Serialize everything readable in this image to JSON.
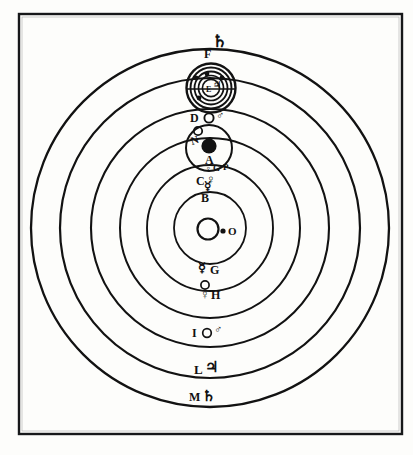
{
  "figure": {
    "caption": "",
    "frame_color": "#17181a",
    "ink_color": "#111111",
    "paper_color": "#fdfdfb",
    "corner_mark": ""
  },
  "center": {
    "body_name": "sun",
    "label": "O",
    "symbol": ""
  },
  "orbits": [
    {
      "key": "B",
      "label": "B",
      "symbol": "☿",
      "body": "mercury",
      "radius": 38,
      "label_angle": "bottom"
    },
    {
      "key": "C",
      "label": "C",
      "symbol": "♀",
      "body": "venus",
      "radius": 62,
      "label_angle": "top"
    },
    {
      "key": "A",
      "label": "A",
      "symbol": "",
      "body": "earth",
      "radius": 88,
      "label_angle": "top"
    },
    {
      "key": "D",
      "label": "D",
      "symbol": "♂",
      "body": "mars",
      "radius": 118,
      "label_angle": "top"
    },
    {
      "key": "F",
      "label": "F",
      "symbol": "♃",
      "body": "jupiter",
      "radius": 156,
      "label_angle": "top"
    },
    {
      "key": "M",
      "label": "M",
      "symbol": "♄",
      "body": "saturn",
      "radius": 190,
      "label_angle": "bottom"
    }
  ],
  "orbit_labels_lower": [
    {
      "key": "G",
      "label": "G",
      "symbol": "☿",
      "body": "mercury-lower"
    },
    {
      "key": "H",
      "label": "H",
      "symbol": "♀",
      "body": "venus-lower"
    },
    {
      "key": "I",
      "label": "I",
      "symbol": "♂",
      "body": "mars-lower"
    },
    {
      "key": "L",
      "label": "L",
      "symbol": "♃",
      "body": "jupiter-lower"
    },
    {
      "key": "M",
      "label": "M",
      "symbol": "♄",
      "body": "saturn-lower"
    }
  ],
  "jupiter_system": {
    "name": "jupiter-with-medicean-moons",
    "planet_label": "F",
    "planet_symbol": "♃",
    "top_symbol": "♄",
    "inner_label": "E",
    "moon_count": 4,
    "moon_names": [
      "io",
      "europa",
      "ganymede",
      "callisto"
    ]
  },
  "earth_system": {
    "name": "earth-with-moon",
    "planet_label": "A",
    "moon_orbit_label": "N",
    "moon_label": "N"
  },
  "mars_marker": {
    "label": "D",
    "symbol": "♂"
  },
  "inner_cluster": {
    "venus_label": "C",
    "venus_symbol": "♀",
    "mercury_label": "B",
    "mercury_symbol": "☿",
    "aux_label_g": "G",
    "aux_label_p": "P"
  }
}
